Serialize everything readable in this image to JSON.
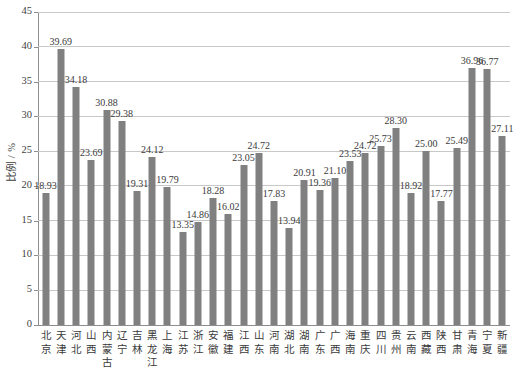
{
  "chart_data": {
    "type": "bar",
    "title": "",
    "subtitle": "",
    "xlabel": "",
    "ylabel": "比例 / %",
    "ylim": [
      0,
      45
    ],
    "ytick_step": 5,
    "yticks": [
      0,
      5,
      10,
      15,
      20,
      25,
      30,
      35,
      40,
      45
    ],
    "grid": true,
    "legend": false,
    "legend_position": "none",
    "bar_color": "#808080",
    "gridline_color": "#c8c8c8",
    "axis_color": "#8e8e8e",
    "value_label_format": "2 decimal places, shown above each bar",
    "categories": [
      "北京",
      "天津",
      "河北",
      "山西",
      "内蒙古",
      "辽宁",
      "吉林",
      "黑龙江",
      "上海",
      "江苏",
      "浙江",
      "安徽",
      "福建",
      "江西",
      "山东",
      "河南",
      "湖北",
      "湖南",
      "广东",
      "广西",
      "海南",
      "重庆",
      "四川",
      "贵州",
      "云南",
      "西藏",
      "陕西",
      "甘肃",
      "青海",
      "宁夏",
      "新疆"
    ],
    "values": [
      18.93,
      39.69,
      34.18,
      23.69,
      30.88,
      29.38,
      19.31,
      24.12,
      19.79,
      13.35,
      14.86,
      18.28,
      16.02,
      23.05,
      24.72,
      17.83,
      13.94,
      20.91,
      19.36,
      21.1,
      23.53,
      24.72,
      25.73,
      28.3,
      18.92,
      25.0,
      17.77,
      25.49,
      36.96,
      36.77,
      27.11
    ],
    "value_labels": [
      "18.93",
      "39.69",
      "34.18",
      "23.69",
      "30.88",
      "29.38",
      "19.31",
      "24.12",
      "19.79",
      "13.35",
      "14.86",
      "18.28",
      "16.02",
      "23.05",
      "24.72",
      "17.83",
      "13.94",
      "20.91",
      "19.36",
      "21.10",
      "23.53",
      "24.72",
      "25.73",
      "28.30",
      "18.92",
      "25.00",
      "17.77",
      "25.49",
      "36.96",
      "36.77",
      "27.11"
    ],
    "ytick_labels": [
      "0",
      "5",
      "10",
      "15",
      "20",
      "25",
      "30",
      "35",
      "40",
      "45"
    ]
  }
}
